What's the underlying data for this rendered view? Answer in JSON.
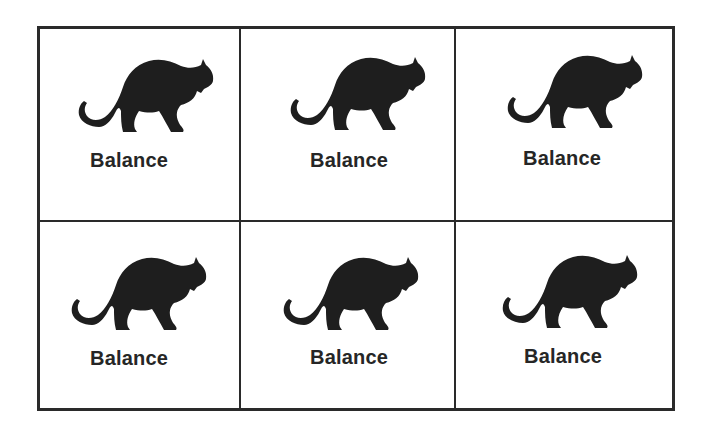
{
  "worksheet": {
    "cells": [
      {
        "label": "Balance",
        "icon": "panther-icon"
      },
      {
        "label": "Balance",
        "icon": "panther-icon"
      },
      {
        "label": "Balance",
        "icon": "panther-icon"
      },
      {
        "label": "Balance",
        "icon": "panther-icon"
      },
      {
        "label": "Balance",
        "icon": "panther-icon"
      },
      {
        "label": "Balance",
        "icon": "panther-icon"
      }
    ]
  },
  "colors": {
    "ink": "#262626",
    "border": "#2a2a2a",
    "background": "#ffffff"
  }
}
